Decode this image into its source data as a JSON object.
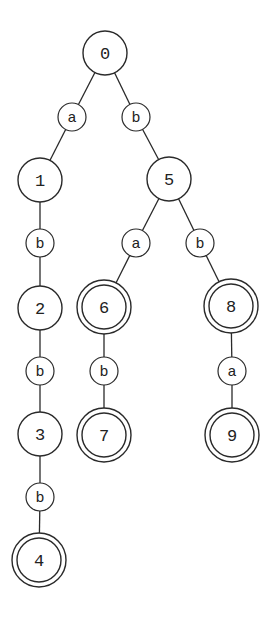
{
  "diagram": {
    "type": "trie",
    "colors": {
      "stroke": "#2a2a2a",
      "background": "#ffffff",
      "text": "#222222"
    },
    "nodes": [
      {
        "id": "0",
        "label": "0",
        "x": 105,
        "y": 53,
        "accepting": false
      },
      {
        "id": "1",
        "label": "1",
        "x": 40,
        "y": 180,
        "accepting": false
      },
      {
        "id": "2",
        "label": "2",
        "x": 40,
        "y": 308,
        "accepting": false
      },
      {
        "id": "3",
        "label": "3",
        "x": 40,
        "y": 434,
        "accepting": false
      },
      {
        "id": "4",
        "label": "4",
        "x": 39,
        "y": 560,
        "accepting": true
      },
      {
        "id": "5",
        "label": "5",
        "x": 169,
        "y": 179,
        "accepting": false
      },
      {
        "id": "6",
        "label": "6",
        "x": 104,
        "y": 307,
        "accepting": true
      },
      {
        "id": "7",
        "label": "7",
        "x": 104,
        "y": 435,
        "accepting": true
      },
      {
        "id": "8",
        "label": "8",
        "x": 231,
        "y": 306,
        "accepting": true
      },
      {
        "id": "9",
        "label": "9",
        "x": 232,
        "y": 435,
        "accepting": true
      }
    ],
    "edges": [
      {
        "from": "0",
        "to": "1",
        "label": "a",
        "lx": 72,
        "ly": 117
      },
      {
        "from": "0",
        "to": "5",
        "label": "b",
        "lx": 136,
        "ly": 117
      },
      {
        "from": "1",
        "to": "2",
        "label": "b",
        "lx": 40,
        "ly": 243
      },
      {
        "from": "2",
        "to": "3",
        "label": "b",
        "lx": 40,
        "ly": 371
      },
      {
        "from": "3",
        "to": "4",
        "label": "b",
        "lx": 40,
        "ly": 497
      },
      {
        "from": "5",
        "to": "6",
        "label": "a",
        "lx": 136,
        "ly": 243
      },
      {
        "from": "5",
        "to": "8",
        "label": "b",
        "lx": 200,
        "ly": 243
      },
      {
        "from": "6",
        "to": "7",
        "label": "b",
        "lx": 104,
        "ly": 371
      },
      {
        "from": "8",
        "to": "9",
        "label": "a",
        "lx": 232,
        "ly": 371
      }
    ]
  }
}
